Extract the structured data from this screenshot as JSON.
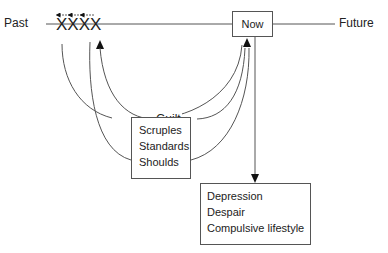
{
  "timeline": {
    "past_label": "Past",
    "future_label": "Future",
    "now_label": "Now",
    "marks": "XXXX"
  },
  "labels": {
    "guilt": "Guilt"
  },
  "scruples_box": {
    "lines": [
      "Scruples",
      "Standards",
      "Shoulds"
    ]
  },
  "outcome_box": {
    "lines": [
      "Depression",
      "Despair",
      "Compulsive lifestyle"
    ]
  },
  "colors": {
    "line": "#555555",
    "text": "#222222",
    "background": "#ffffff"
  }
}
